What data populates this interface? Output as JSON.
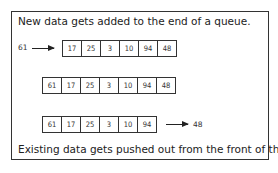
{
  "diagram": {
    "top_caption": "New data gets added to the end of a queue.",
    "bottom_caption": "Existing data gets pushed out from the front of the queue.",
    "step1": {
      "incoming": "61",
      "queue": [
        "17",
        "25",
        "3",
        "10",
        "94",
        "48"
      ]
    },
    "step2": {
      "queue": [
        "61",
        "17",
        "25",
        "3",
        "10",
        "94",
        "48"
      ]
    },
    "step3": {
      "queue": [
        "61",
        "17",
        "25",
        "3",
        "10",
        "94"
      ],
      "outgoing": "48"
    }
  }
}
